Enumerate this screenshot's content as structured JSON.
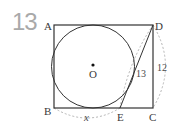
{
  "problem": {
    "number": "13"
  },
  "figure": {
    "points": {
      "A": "A",
      "B": "B",
      "C": "C",
      "D": "D",
      "E": "E",
      "O": "O"
    },
    "measures": {
      "DE": "13",
      "DC": "12",
      "BE": "x"
    },
    "colors": {
      "stroke": "#333333",
      "dashed": "#b5b5b5",
      "number": "#a9a9a9"
    }
  }
}
